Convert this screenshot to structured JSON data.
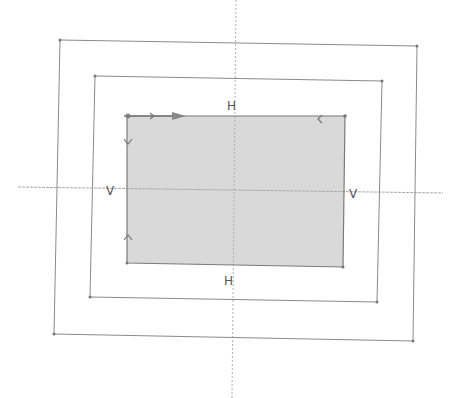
{
  "diagram": {
    "type": "sketch",
    "colors": {
      "background": "#ffffff",
      "line": "#8a8a8a",
      "axis": "#a8a8a8",
      "fill": "#d9d9d9",
      "label": "#555555"
    },
    "axes": {
      "horizontal": {
        "x1": 18,
        "y1": 187,
        "x2": 443,
        "y2": 193
      },
      "vertical": {
        "x1": 236,
        "y1": 0,
        "x2": 232,
        "y2": 398
      }
    },
    "rectangles": [
      {
        "name": "outer",
        "points": [
          [
            60,
            40
          ],
          [
            417,
            46
          ],
          [
            413,
            341
          ],
          [
            54,
            334
          ]
        ]
      },
      {
        "name": "middle",
        "points": [
          [
            95,
            76
          ],
          [
            382,
            81
          ],
          [
            377,
            302
          ],
          [
            90,
            297
          ]
        ]
      },
      {
        "name": "inner",
        "points": [
          [
            127,
            116
          ],
          [
            345,
            116
          ],
          [
            343,
            267
          ],
          [
            127,
            263
          ]
        ],
        "filled": true
      }
    ],
    "labels": {
      "h_top": "H",
      "h_bottom": "H",
      "v_left": "V",
      "v_right": "V"
    }
  }
}
